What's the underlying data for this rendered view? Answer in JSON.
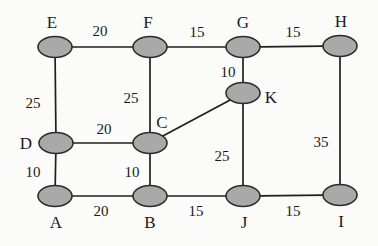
{
  "figure": {
    "kind": "weighted-undirected-graph",
    "background_color": "#fbfbfa",
    "node_fill_color": "#a9a9a9",
    "node_stroke_color": "#2b2b2b",
    "edge_color": "#1f1f1f",
    "text_color": "#1a1a1a"
  },
  "nodes": [
    {
      "id": "E",
      "label": "E",
      "cx": 55,
      "cy": 47,
      "rx": 17,
      "ry": 10.5,
      "label_x": 52,
      "label_y": 22
    },
    {
      "id": "F",
      "label": "F",
      "cx": 150,
      "cy": 47,
      "rx": 17,
      "ry": 10.5,
      "label_x": 148,
      "label_y": 22
    },
    {
      "id": "G",
      "label": "G",
      "cx": 243,
      "cy": 47,
      "rx": 17,
      "ry": 10.5,
      "label_x": 243,
      "label_y": 22
    },
    {
      "id": "H",
      "label": "H",
      "cx": 340,
      "cy": 46,
      "rx": 17,
      "ry": 10.5,
      "label_x": 341,
      "label_y": 21
    },
    {
      "id": "K",
      "label": "K",
      "cx": 243,
      "cy": 93,
      "rx": 17,
      "ry": 10.5,
      "label_x": 271,
      "label_y": 97
    },
    {
      "id": "D",
      "label": "D",
      "cx": 56,
      "cy": 143,
      "rx": 17,
      "ry": 10.5,
      "label_x": 26,
      "label_y": 143
    },
    {
      "id": "C",
      "label": "C",
      "cx": 150,
      "cy": 143,
      "rx": 17,
      "ry": 10.5,
      "label_x": 162,
      "label_y": 122
    },
    {
      "id": "A",
      "label": "A",
      "cx": 55,
      "cy": 196,
      "rx": 17,
      "ry": 10.5,
      "label_x": 56,
      "label_y": 222
    },
    {
      "id": "B",
      "label": "B",
      "cx": 150,
      "cy": 196,
      "rx": 17,
      "ry": 10.5,
      "label_x": 150,
      "label_y": 222
    },
    {
      "id": "J",
      "label": "J",
      "cx": 243,
      "cy": 196,
      "rx": 17,
      "ry": 10.5,
      "label_x": 244,
      "label_y": 222
    },
    {
      "id": "I",
      "label": "I",
      "cx": 340,
      "cy": 195,
      "rx": 17,
      "ry": 10.5,
      "label_x": 341,
      "label_y": 221
    }
  ],
  "edges": [
    {
      "from": "E",
      "to": "F",
      "weight": "20",
      "label_x": 100,
      "label_y": 31
    },
    {
      "from": "F",
      "to": "G",
      "weight": "15",
      "label_x": 197,
      "label_y": 32
    },
    {
      "from": "G",
      "to": "H",
      "weight": "15",
      "label_x": 293,
      "label_y": 32
    },
    {
      "from": "E",
      "to": "D",
      "weight": "25",
      "label_x": 33,
      "label_y": 103
    },
    {
      "from": "F",
      "to": "C",
      "weight": "25",
      "label_x": 131,
      "label_y": 98
    },
    {
      "from": "G",
      "to": "K",
      "weight": "10",
      "label_x": 228,
      "label_y": 72
    },
    {
      "from": "H",
      "to": "I",
      "weight": "35",
      "label_x": 321,
      "label_y": 142
    },
    {
      "from": "D",
      "to": "C",
      "weight": "20",
      "label_x": 104,
      "label_y": 129
    },
    {
      "from": "C",
      "to": "K",
      "weight": "",
      "label_x": 0,
      "label_y": 0
    },
    {
      "from": "D",
      "to": "A",
      "weight": "10",
      "label_x": 33,
      "label_y": 172
    },
    {
      "from": "C",
      "to": "B",
      "weight": "10",
      "label_x": 132,
      "label_y": 172
    },
    {
      "from": "K",
      "to": "J",
      "weight": "25",
      "label_x": 222,
      "label_y": 156
    },
    {
      "from": "A",
      "to": "B",
      "weight": "20",
      "label_x": 101,
      "label_y": 211
    },
    {
      "from": "B",
      "to": "J",
      "weight": "15",
      "label_x": 196,
      "label_y": 211
    },
    {
      "from": "J",
      "to": "I",
      "weight": "15",
      "label_x": 293,
      "label_y": 211
    }
  ]
}
